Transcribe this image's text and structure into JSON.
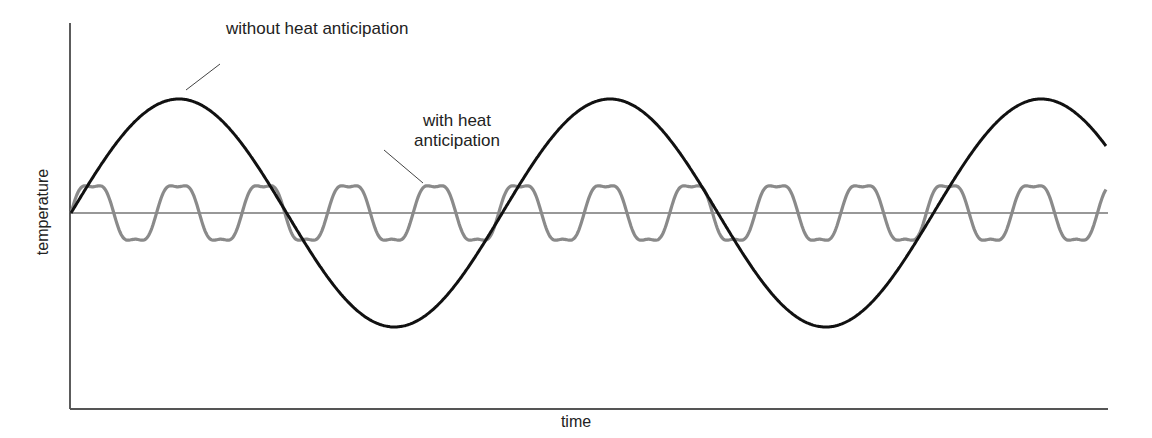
{
  "figure": {
    "xlabel": "time",
    "ylabel": "temperature",
    "annotations": {
      "without": "without heat anticipation",
      "with_line1": "with heat",
      "with_line2": "anticipation"
    },
    "colors": {
      "axis": "#333333",
      "without": "#111111",
      "with": "#8a8a8a",
      "setpoint": "#333333"
    }
  },
  "chart_data": {
    "type": "line",
    "title": "",
    "xlabel": "time",
    "ylabel": "temperature",
    "grid": false,
    "legend": "none (curves labeled directly with leader lines)",
    "setpoint_line": "horizontal reference line at mid temperature",
    "series": [
      {
        "name": "without heat anticipation",
        "style": "thick black sine wave, large amplitude, long period",
        "cycles_shown": 2.4,
        "relative_amplitude": 1.0
      },
      {
        "name": "with heat anticipation",
        "style": "gray rounded wave, small amplitude, short period",
        "cycles_shown": 12.1,
        "relative_amplitude": 0.24
      }
    ]
  }
}
